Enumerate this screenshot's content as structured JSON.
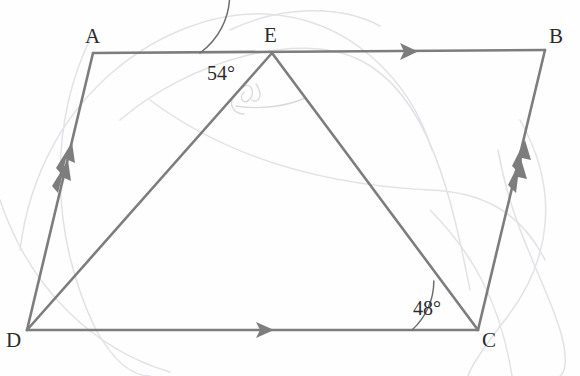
{
  "figure": {
    "background_color": "#fefefe",
    "stroke_color": "#7d7d7d",
    "arc_color": "#6e6e6e",
    "faint_color": "#e3e1e6",
    "label_color": "#2b2b2b",
    "stroke_width": 2.6,
    "vertices": [
      {
        "name": "A",
        "label": "A",
        "x": 93,
        "y": 53,
        "label_x": 85,
        "label_y": 26
      },
      {
        "name": "B",
        "label": "B",
        "x": 545,
        "y": 50,
        "label_x": 549,
        "label_y": 26
      },
      {
        "name": "C",
        "label": "C",
        "x": 478,
        "y": 330,
        "label_x": 482,
        "label_y": 330
      },
      {
        "name": "D",
        "label": "D",
        "x": 27,
        "y": 330,
        "label_x": 6,
        "label_y": 330
      },
      {
        "name": "E",
        "label": "E",
        "x": 272,
        "y": 53,
        "label_x": 264,
        "label_y": 25
      }
    ],
    "segments": [
      {
        "name": "segment-AB",
        "from": "A",
        "to": "B",
        "arrow_marks": 1,
        "arrow_at": 0.7
      },
      {
        "name": "segment-DC",
        "from": "D",
        "to": "C",
        "arrow_marks": 1,
        "arrow_at": 0.53
      },
      {
        "name": "segment-AD",
        "from": "D",
        "to": "A",
        "arrow_marks": 2,
        "arrow_at": 0.62
      },
      {
        "name": "segment-BC",
        "from": "C",
        "to": "B",
        "arrow_marks": 2,
        "arrow_at": 0.62
      },
      {
        "name": "segment-DE",
        "from": "D",
        "to": "E",
        "arrow_marks": 0
      },
      {
        "name": "segment-EC",
        "from": "E",
        "to": "C",
        "arrow_marks": 0
      }
    ],
    "angles": [
      {
        "name": "angle-at-E",
        "value": "54°",
        "vertex": "E",
        "radius": 72,
        "start_deg": 180,
        "end_deg": 126,
        "label_x": 207,
        "label_y": 63
      },
      {
        "name": "angle-at-C",
        "value": "48°",
        "vertex": "C",
        "radius": 66,
        "start_deg": 180,
        "end_deg": 132,
        "label_x": 413,
        "label_y": 298
      }
    ],
    "parallel_pairs": [
      {
        "pair": "AB ‖ DC",
        "marks": 1
      },
      {
        "pair": "AD ‖ BC",
        "marks": 2
      }
    ],
    "faint_construction_marks": true
  }
}
